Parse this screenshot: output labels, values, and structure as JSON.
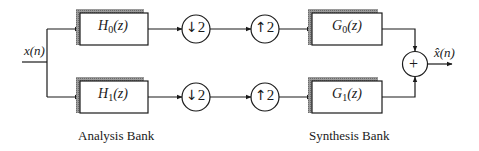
{
  "diagram": {
    "type": "two-channel filter bank",
    "input_label": "x(n)",
    "output_label": "x̂(n)",
    "analysis": {
      "title": "Analysis Bank",
      "filters": [
        {
          "name": "H",
          "index": "0",
          "arg": "(z)"
        },
        {
          "name": "H",
          "index": "1",
          "arg": "(z)"
        }
      ],
      "downsamplers": [
        {
          "arrow": "↓",
          "factor": "2"
        },
        {
          "arrow": "↓",
          "factor": "2"
        }
      ]
    },
    "synthesis": {
      "title": "Synthesis Bank",
      "upsamplers": [
        {
          "arrow": "↑",
          "factor": "2"
        },
        {
          "arrow": "↑",
          "factor": "2"
        }
      ],
      "filters": [
        {
          "name": "G",
          "index": "0",
          "arg": "(z)"
        },
        {
          "name": "G",
          "index": "1",
          "arg": "(z)"
        }
      ]
    },
    "adder": {
      "symbol": "+"
    },
    "colors": {
      "stroke": "#1a1a1a",
      "shadow": "#8a8a8a",
      "background": "#ffffff"
    }
  }
}
